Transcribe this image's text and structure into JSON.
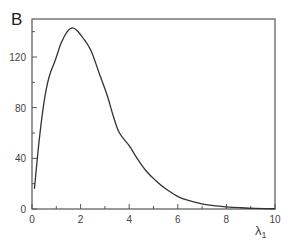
{
  "chart_data": {
    "type": "line",
    "panel_label": "B",
    "title": "",
    "xlabel": "λ",
    "xlabel_subscript": "1",
    "ylabel": "",
    "xlim": [
      0,
      10
    ],
    "ylim": [
      0,
      150
    ],
    "x_major_ticks": [
      0,
      2,
      4,
      6,
      8,
      10
    ],
    "x_tick_labels": [
      "0",
      "2",
      "4",
      "6",
      "8",
      "10"
    ],
    "x_minor_ticks": [
      1,
      3,
      5,
      7,
      9
    ],
    "y_major_ticks": [
      0,
      40,
      80,
      120
    ],
    "y_tick_labels": [
      "0",
      "40",
      "80",
      "120"
    ],
    "y_minor_ticks": [
      20,
      60,
      100,
      140
    ],
    "grid": false,
    "legend": "none",
    "series": [
      {
        "name": "curve",
        "color": "#333333",
        "x": [
          0.1,
          0.3,
          0.5,
          0.7,
          0.95,
          1.2,
          1.45,
          1.65,
          1.85,
          2.1,
          2.43,
          2.75,
          3.09,
          3.35,
          3.6,
          4.0,
          4.36,
          4.7,
          5.06,
          5.5,
          6.1,
          6.7,
          7.3,
          8.0,
          8.6,
          9.2,
          10.0
        ],
        "y": [
          16,
          55,
          85,
          104,
          117,
          131,
          140,
          143,
          141,
          135,
          125,
          108,
          90,
          73,
          60,
          50,
          39,
          30,
          23,
          16,
          9,
          5.5,
          3,
          1.7,
          1,
          0.5,
          0.2
        ]
      }
    ]
  }
}
